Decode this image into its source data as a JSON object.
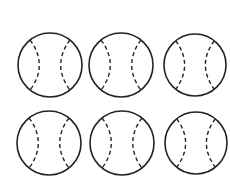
{
  "figure": {
    "stroke_color": "#222222",
    "background": "#ffffff",
    "balls": [
      {
        "cx": 50,
        "cy": 65,
        "r": 32
      },
      {
        "cx": 121,
        "cy": 65,
        "r": 32
      },
      {
        "cx": 195,
        "cy": 65,
        "r": 31
      },
      {
        "cx": 49,
        "cy": 143,
        "r": 32
      },
      {
        "cx": 122,
        "cy": 143,
        "r": 32
      },
      {
        "cx": 196,
        "cy": 143,
        "r": 31
      }
    ]
  }
}
